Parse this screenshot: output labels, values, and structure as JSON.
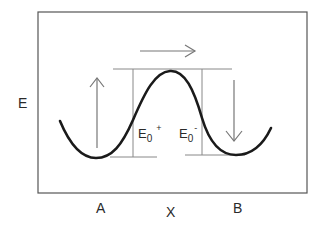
{
  "diagram": {
    "type": "double-well energy profile",
    "y_axis_label": "E",
    "x_axis_label": "X",
    "well_labels": {
      "left": "A",
      "right": "B"
    },
    "barrier_labels": {
      "forward": {
        "base": "E",
        "sub": "0",
        "sup": "+"
      },
      "reverse": {
        "base": "E",
        "sub": "0",
        "sup": "-"
      }
    },
    "arrows": {
      "top": "right",
      "left": "up",
      "right": "down"
    },
    "colors": {
      "frame": "#555555",
      "curve": "#1a1a1a",
      "guide_lines": "#888888",
      "arrows": "#777777",
      "text": "#2a2a2a"
    }
  }
}
